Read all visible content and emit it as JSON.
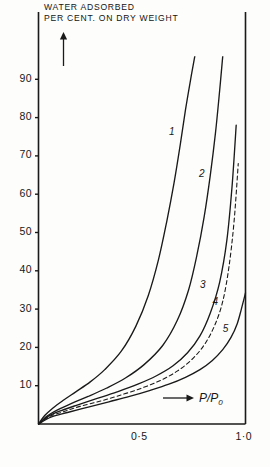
{
  "figure": {
    "title_line1": "WATER ADSORBED",
    "title_line2": "PER CENT. ON DRY WEIGHT",
    "x_axis_label": "P/P",
    "x_axis_label_sub": "0",
    "y_arrow": "up-arrow",
    "x_arrow": "right-arrow"
  },
  "chart_data": {
    "type": "line",
    "title": "WATER ADSORBED PER CENT. ON DRY WEIGHT",
    "xlabel": "P/P0",
    "ylabel": "WATER ADSORBED PER CENT. ON DRY WEIGHT",
    "xlim": [
      0,
      1.0
    ],
    "ylim": [
      0,
      95
    ],
    "grid": false,
    "legend": "inline-curve-numbers",
    "xticks": [
      0.5,
      1.0
    ],
    "xticklabels": [
      "0·5",
      "1·0"
    ],
    "yticks": [
      10,
      20,
      30,
      40,
      50,
      60,
      70,
      80,
      90
    ],
    "yticklabels": [
      "10",
      "20",
      "30",
      "40",
      "50",
      "60",
      "70",
      "80",
      "90"
    ],
    "series": [
      {
        "name": "1",
        "style": "solid",
        "label_x": 0.645,
        "label_y": 76,
        "x": [
          0.0,
          0.03,
          0.07,
          0.12,
          0.18,
          0.25,
          0.32,
          0.4,
          0.47,
          0.53,
          0.58,
          0.62,
          0.655,
          0.685,
          0.71,
          0.735,
          0.755
        ],
        "y": [
          0.0,
          2.2,
          4.2,
          6.2,
          8.4,
          11.0,
          14.2,
          19.0,
          25.5,
          33.5,
          43.0,
          53.0,
          63.0,
          73.0,
          82.0,
          90.0,
          96.0
        ]
      },
      {
        "name": "2",
        "style": "solid",
        "label_x": 0.79,
        "label_y": 65,
        "x": [
          0.0,
          0.04,
          0.09,
          0.16,
          0.24,
          0.33,
          0.42,
          0.51,
          0.6,
          0.67,
          0.725,
          0.765,
          0.8,
          0.83,
          0.855,
          0.875,
          0.89
        ],
        "y": [
          0.0,
          2.0,
          3.6,
          5.4,
          7.2,
          9.4,
          12.0,
          15.5,
          20.5,
          27.0,
          35.0,
          44.0,
          54.0,
          65.0,
          76.0,
          87.0,
          96.0
        ]
      },
      {
        "name": "3",
        "style": "solid",
        "label_x": 0.795,
        "label_y": 36,
        "x": [
          0.0,
          0.05,
          0.11,
          0.19,
          0.28,
          0.38,
          0.48,
          0.57,
          0.65,
          0.72,
          0.78,
          0.83,
          0.875,
          0.91,
          0.935,
          0.955
        ],
        "y": [
          0.0,
          2.1,
          3.5,
          5.0,
          6.6,
          8.4,
          10.4,
          12.6,
          15.2,
          18.6,
          23.0,
          29.0,
          37.0,
          48.0,
          62.0,
          78.0
        ]
      },
      {
        "name": "4",
        "style": "dashed",
        "label_x": 0.855,
        "label_y": 31.5,
        "x": [
          0.0,
          0.05,
          0.12,
          0.2,
          0.3,
          0.4,
          0.5,
          0.59,
          0.67,
          0.74,
          0.8,
          0.85,
          0.89,
          0.92,
          0.945,
          0.965
        ],
        "y": [
          0.0,
          1.9,
          3.2,
          4.6,
          6.0,
          7.6,
          9.4,
          11.4,
          13.8,
          16.8,
          20.6,
          25.6,
          32.0,
          41.0,
          53.0,
          68.0
        ]
      },
      {
        "name": "5",
        "style": "solid",
        "label_x": 0.905,
        "label_y": 24.5,
        "x": [
          0.0,
          0.06,
          0.14,
          0.24,
          0.34,
          0.44,
          0.54,
          0.63,
          0.71,
          0.78,
          0.84,
          0.89,
          0.93,
          0.96,
          0.98,
          1.0
        ],
        "y": [
          0.0,
          1.8,
          3.0,
          4.4,
          5.8,
          7.2,
          8.8,
          10.4,
          12.2,
          14.2,
          16.6,
          19.4,
          22.6,
          26.2,
          30.0,
          34.2
        ]
      }
    ]
  }
}
